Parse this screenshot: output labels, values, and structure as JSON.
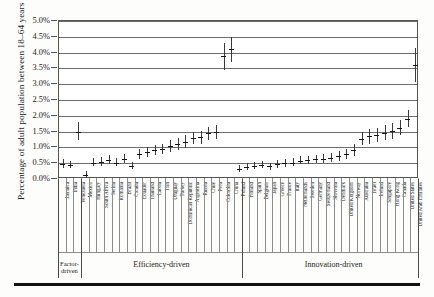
{
  "axis": {
    "y_title": "Percentage of adult population between 18–64 years",
    "y_ticks": [
      "0.0%",
      "0.5%",
      "1.0%",
      "1.5%",
      "2.0%",
      "2.5%",
      "3.0%",
      "3.5%",
      "4.0%",
      "4.5%",
      "5.0%"
    ]
  },
  "groups": [
    {
      "label": "Factor-driven",
      "start": 0,
      "end": 3
    },
    {
      "label": "Efficiency-driven",
      "start": 3,
      "end": 24
    },
    {
      "label": "Innovation-driven",
      "start": 24,
      "end": 48
    }
  ],
  "chart_data": {
    "type": "scatter",
    "title": "",
    "xlabel": "",
    "ylabel": "Percentage of adult population between 18–64 years",
    "ylim": [
      0,
      5
    ],
    "ytick_step": 0.5,
    "grid": true,
    "legend": "none",
    "error_bars": "vertical 95% interval",
    "units": "percent",
    "categories": [
      "Jamaica",
      "India",
      "Venezuela",
      "Mexico",
      "Hungary",
      "South Africa",
      "Serbia",
      "Romania",
      "Brazil",
      "Croatia",
      "Ecuador",
      "Thailand",
      "Latvia",
      "Iran",
      "Uruguay",
      "Turkey",
      "Dominican Republic",
      "Argentina",
      "Russia",
      "Chile",
      "Peru",
      "Colombia",
      "China",
      "Poland",
      "Finland",
      "Spain",
      "Belgium",
      "Japan",
      "Greece",
      "France",
      "Italy",
      "Netherlands",
      "Sweden",
      "Germany",
      "Switzerland",
      "Slovenia",
      "Denmark",
      "United Kingdom",
      "Norway",
      "Australia",
      "Israel",
      "Ireland",
      "Singapore",
      "Hong Kong",
      "Canada",
      "United States",
      "United Arab Emirates"
    ],
    "values": [
      0.48,
      0.45,
      1.5,
      0.12,
      0.52,
      0.55,
      0.6,
      0.52,
      0.63,
      0.42,
      0.78,
      0.86,
      0.92,
      0.95,
      1.05,
      1.1,
      1.18,
      1.3,
      1.32,
      1.45,
      1.48,
      3.88,
      4.1,
      0.32,
      0.38,
      0.42,
      0.45,
      0.4,
      0.48,
      0.5,
      0.52,
      0.58,
      0.6,
      0.62,
      0.64,
      0.68,
      0.72,
      0.78,
      0.92,
      1.28,
      1.35,
      1.38,
      1.45,
      1.52,
      1.62,
      1.9,
      3.6
    ],
    "err_low": [
      0.36,
      0.34,
      1.22,
      0.04,
      0.4,
      0.42,
      0.46,
      0.4,
      0.5,
      0.32,
      0.62,
      0.7,
      0.76,
      0.78,
      0.86,
      0.92,
      0.98,
      1.1,
      1.12,
      1.24,
      1.26,
      3.46,
      3.7,
      0.22,
      0.28,
      0.32,
      0.34,
      0.3,
      0.36,
      0.38,
      0.4,
      0.46,
      0.48,
      0.5,
      0.52,
      0.54,
      0.58,
      0.62,
      0.74,
      1.06,
      1.12,
      1.16,
      1.22,
      1.28,
      1.38,
      1.64,
      3.08
    ],
    "err_high": [
      0.62,
      0.58,
      1.8,
      0.24,
      0.66,
      0.7,
      0.76,
      0.66,
      0.78,
      0.54,
      0.94,
      1.02,
      1.08,
      1.12,
      1.24,
      1.3,
      1.38,
      1.5,
      1.52,
      1.66,
      1.7,
      4.3,
      4.5,
      0.44,
      0.5,
      0.54,
      0.58,
      0.52,
      0.6,
      0.62,
      0.66,
      0.72,
      0.74,
      0.76,
      0.78,
      0.82,
      0.88,
      0.94,
      1.1,
      1.5,
      1.58,
      1.62,
      1.7,
      1.78,
      1.88,
      2.18,
      4.16
    ]
  }
}
